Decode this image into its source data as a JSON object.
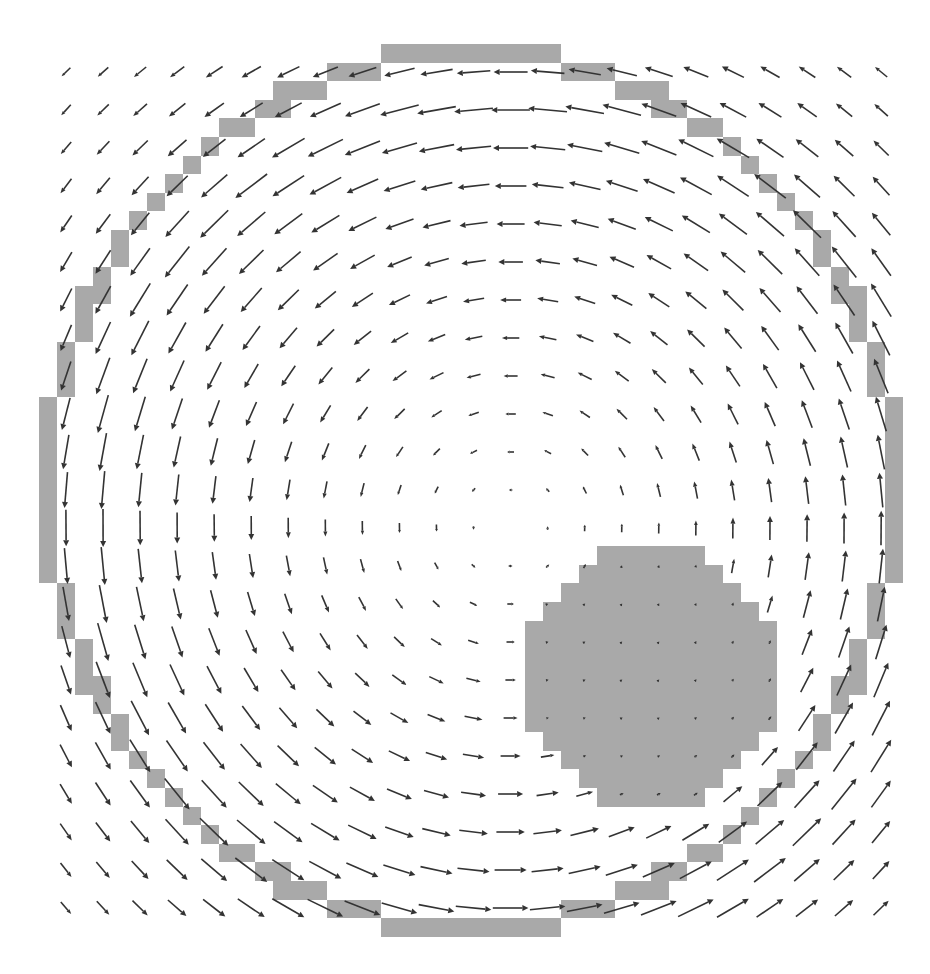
{
  "figure": {
    "title": "",
    "width": 930,
    "height": 974,
    "background": "#ffffff"
  },
  "chart_data": {
    "type": "quiver",
    "title": "",
    "xlabel": "",
    "ylabel": "",
    "axes_visible": false,
    "grid": false,
    "legend": null,
    "colors": {
      "arrow": "#333333",
      "wall": "#a9a9a9"
    },
    "quiver_grid": {
      "cols": 23,
      "rows": 23,
      "x0_px": 66,
      "y0_px": 72,
      "dx_px": 37.05,
      "dy_px": 38.0,
      "pivot": "middle"
    },
    "field_model": {
      "rotation": "counter-clockwise",
      "vortex_center_px": [
        510,
        526
      ],
      "max_arrow_len_px": 40,
      "core_radius_px": 430,
      "outer_decay_exponent": 3,
      "obstacle_damping": 0.15,
      "obstacle_influence_px": 40
    },
    "wall_ring": {
      "cell_grid_origin_px": [
        39,
        44
      ],
      "cell_w_px": 18.0,
      "cell_h_px": 18.6,
      "grid_size": 48,
      "top_left_octant_rows": [
        {
          "row": 0,
          "cols": [
            19,
            23
          ]
        },
        {
          "row": 1,
          "cols": [
            16,
            18
          ]
        },
        {
          "row": 2,
          "cols": [
            13,
            15
          ]
        },
        {
          "row": 3,
          "cols": [
            12,
            13
          ]
        },
        {
          "row": 4,
          "cols": [
            10,
            11
          ]
        },
        {
          "row": 5,
          "cols": [
            9,
            9
          ]
        },
        {
          "row": 6,
          "cols": [
            8,
            8
          ]
        },
        {
          "row": 7,
          "cols": [
            7,
            7
          ]
        },
        {
          "row": 8,
          "cols": [
            6,
            6
          ]
        },
        {
          "row": 9,
          "cols": [
            5,
            5
          ]
        },
        {
          "row": 10,
          "cols": [
            4,
            4
          ]
        },
        {
          "row": 11,
          "cols": [
            4,
            4
          ]
        },
        {
          "row": 12,
          "cols": [
            3,
            3
          ]
        },
        {
          "row": 13,
          "cols": [
            2,
            3
          ]
        },
        {
          "row": 14,
          "cols": [
            2,
            2
          ]
        },
        {
          "row": 15,
          "cols": [
            2,
            2
          ]
        },
        {
          "row": 16,
          "cols": [
            1,
            1
          ]
        },
        {
          "row": 17,
          "cols": [
            1,
            1
          ]
        },
        {
          "row": 18,
          "cols": [
            1,
            1
          ]
        },
        {
          "row": 19,
          "cols": [
            0,
            0
          ]
        },
        {
          "row": 20,
          "cols": [
            0,
            0
          ]
        },
        {
          "row": 21,
          "cols": [
            0,
            0
          ]
        },
        {
          "row": 22,
          "cols": [
            0,
            0
          ]
        },
        {
          "row": 23,
          "cols": [
            0,
            0
          ]
        }
      ]
    },
    "obstacle_disk": {
      "center_px": [
        651,
        676
      ],
      "radius_px": 128,
      "rows": [
        {
          "row": 27,
          "cols": [
            31,
            36
          ]
        },
        {
          "row": 28,
          "cols": [
            30,
            37
          ]
        },
        {
          "row": 29,
          "cols": [
            29,
            38
          ]
        },
        {
          "row": 30,
          "cols": [
            28,
            39
          ]
        },
        {
          "row": 31,
          "cols": [
            27,
            40
          ]
        },
        {
          "row": 32,
          "cols": [
            27,
            40
          ]
        },
        {
          "row": 33,
          "cols": [
            27,
            40
          ]
        },
        {
          "row": 34,
          "cols": [
            27,
            40
          ]
        },
        {
          "row": 35,
          "cols": [
            27,
            40
          ]
        },
        {
          "row": 36,
          "cols": [
            27,
            40
          ]
        },
        {
          "row": 37,
          "cols": [
            28,
            39
          ]
        },
        {
          "row": 38,
          "cols": [
            29,
            38
          ]
        },
        {
          "row": 39,
          "cols": [
            30,
            37
          ]
        },
        {
          "row": 40,
          "cols": [
            31,
            36
          ]
        }
      ]
    },
    "sample_vectors_px": [
      {
        "col": 0,
        "row": 0,
        "u": -9,
        "v": 6,
        "note": "top-left corner, short, pointing down-left"
      },
      {
        "col": 11,
        "row": 0,
        "u": -33,
        "v": 0,
        "note": "top middle, long, pointing left"
      },
      {
        "col": 22,
        "row": 0,
        "u": -9,
        "v": -9,
        "note": "top-right corner, pointing up-left"
      },
      {
        "col": 0,
        "row": 11,
        "u": 0,
        "v": 25,
        "note": "left middle, pointing down"
      },
      {
        "col": 22,
        "row": 11,
        "u": 0,
        "v": -30,
        "note": "right middle, pointing up"
      },
      {
        "col": 11,
        "row": 22,
        "u": 30,
        "v": 0,
        "note": "bottom middle, pointing right"
      },
      {
        "col": 12,
        "row": 12,
        "u": 0,
        "v": 0,
        "note": "vortex core, near zero"
      }
    ]
  }
}
